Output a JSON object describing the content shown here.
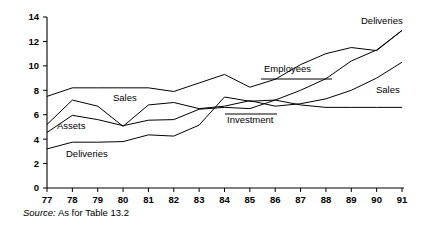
{
  "chart_data": {
    "type": "line",
    "title": "",
    "subtitle": "",
    "xlabel": "",
    "ylabel": "",
    "grid": false,
    "legend_position": "inline-annotations",
    "xlim": [
      77,
      91
    ],
    "ylim": [
      0,
      14
    ],
    "ytick_values": [
      0,
      2,
      4,
      6,
      8,
      10,
      12,
      14
    ],
    "ytick_labels": [
      "0",
      "2",
      "4",
      "6",
      "8",
      "10",
      "12",
      "14"
    ],
    "x": [
      77,
      78,
      79,
      80,
      81,
      82,
      83,
      84,
      85,
      86,
      87,
      88,
      89,
      90,
      91
    ],
    "xtick_labels": [
      "77",
      "78",
      "79",
      "80",
      "81",
      "82",
      "83",
      "84",
      "85",
      "86",
      "87",
      "88",
      "89",
      "90",
      "91"
    ],
    "series": [
      {
        "name": "Deliveries",
        "values": [
          7.5,
          8.2,
          8.2,
          8.2,
          8.2,
          7.9,
          8.6,
          9.3,
          8.25,
          8.9,
          10.1,
          11.0,
          11.5,
          11.25,
          12.9
        ]
      },
      {
        "name": "Sales",
        "values": [
          5.2,
          7.2,
          6.7,
          5.05,
          6.8,
          7.0,
          6.5,
          6.7,
          7.15,
          6.7,
          6.9,
          7.3,
          8.0,
          9.0,
          10.3
        ]
      },
      {
        "name": "Assets",
        "values": [
          4.55,
          5.95,
          5.6,
          5.1,
          5.55,
          5.6,
          6.45,
          6.6,
          6.5,
          7.2,
          8.0,
          8.95,
          10.4,
          11.3,
          12.9
        ]
      },
      {
        "name": "Investment",
        "values": [
          3.2,
          3.75,
          3.75,
          3.8,
          4.35,
          4.25,
          5.15,
          7.45,
          7.1,
          7.2,
          6.8,
          6.6,
          6.6,
          6.6,
          6.6
        ]
      }
    ],
    "annotations": [
      {
        "text": "Sales",
        "x": 113,
        "y": 101,
        "leader": null
      },
      {
        "text": "Assets",
        "x": 57,
        "y": 129,
        "leader": null
      },
      {
        "text": "Deliveries",
        "x": 66,
        "y": 157,
        "leader": null
      },
      {
        "text": "Investment",
        "x": 227,
        "y": 123,
        "leader": {
          "x1": 225,
          "y1": 114,
          "x2": 277,
          "y2": 114
        }
      },
      {
        "text": "Employees",
        "x": 264,
        "y": 72,
        "leader": {
          "x1": 261,
          "y1": 79,
          "x2": 332,
          "y2": 79
        }
      },
      {
        "text": "Deliveries",
        "x": 361,
        "y": 24,
        "leader": null
      },
      {
        "text": "Sales",
        "x": 376,
        "y": 93,
        "leader": null
      }
    ]
  },
  "source": {
    "prefix": "Source:",
    "text": "As for Table 13.2"
  }
}
